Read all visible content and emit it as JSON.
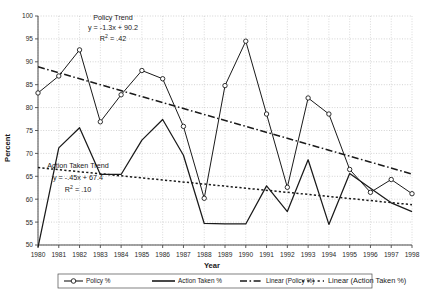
{
  "chart_data": {
    "type": "line",
    "title": "",
    "xlabel": "Year",
    "ylabel": "Percent",
    "ylim": [
      50,
      100
    ],
    "ytick_step": 5,
    "grid": true,
    "legend_position": "bottom",
    "categories": [
      1980,
      1981,
      1982,
      1983,
      1984,
      1985,
      1986,
      1987,
      1988,
      1989,
      1990,
      1991,
      1992,
      1993,
      1994,
      1995,
      1996,
      1997,
      1998
    ],
    "xtick_labels": [
      "1980",
      "1981",
      "1982",
      "1983",
      "1984",
      "1985",
      "1986",
      "1987",
      "1988",
      "1989",
      "1990",
      "1991",
      "1992",
      "1993",
      "1994",
      "1995",
      "1996",
      "1997",
      "1998"
    ],
    "ytick_labels": [
      "50",
      "55",
      "60",
      "65",
      "70",
      "75",
      "80",
      "85",
      "90",
      "95",
      "100"
    ],
    "series": [
      {
        "name": "Policy %",
        "marker": "open-circle",
        "style": "solid",
        "values": [
          83.2,
          86.9,
          92.6,
          76.9,
          82.8,
          88.1,
          86.3,
          75.9,
          60.2,
          84.8,
          94.5,
          78.6,
          62.6,
          82.1,
          78.6,
          66.5,
          61.5,
          64.3,
          61.2
        ]
      },
      {
        "name": "Action Taken %",
        "marker": "none",
        "style": "solid",
        "values": [
          49.5,
          71.2,
          75.6,
          65.4,
          65.4,
          72.9,
          77.4,
          69.6,
          54.7,
          54.6,
          54.6,
          62.9,
          57.3,
          68.6,
          54.5,
          65.6,
          62.4,
          59.2,
          57.3
        ]
      }
    ],
    "trendlines": [
      {
        "name": "Linear (Policy %)",
        "style": "dash-dot",
        "equation": "y = -1.3x + 90.2",
        "r_squared": ".42",
        "label_title": "Policy Trend",
        "slope": -1.3,
        "intercept": 90.2,
        "y_start": 88.9,
        "y_end": 65.5
      },
      {
        "name": "Linear (Action Taken %)",
        "style": "dotted",
        "equation": "y = -.45x + 67.4",
        "r_squared": ".10",
        "label_title": "Action Taken Trend",
        "slope": -0.45,
        "intercept": 67.4,
        "y_start": 66.9,
        "y_end": 58.8
      }
    ],
    "annotations": [
      {
        "id": "policy-trend",
        "line1": "Policy Trend",
        "line2_prefix": "y = -1.3x + 90.2",
        "line3_prefix": "R",
        "line3_sup": "2",
        "line3_suffix": " = .42"
      },
      {
        "id": "action-taken-trend",
        "line1": "Action Taken Trend",
        "line2_prefix": "y = -.45x + 67.4",
        "line3_prefix": "R",
        "line3_sup": "2",
        "line3_suffix": " = .10"
      }
    ],
    "legend": [
      {
        "label": "Policy %",
        "style": "solid-marker"
      },
      {
        "label": "Action Taken %",
        "style": "solid"
      },
      {
        "label": "Linear (Policy %)",
        "style": "dash-dot"
      },
      {
        "label": "Linear (Action Taken %)",
        "style": "dotted"
      }
    ],
    "colors": {
      "line": "#1a1a1a",
      "grid": "#b5b5b5",
      "axis": "#4a4a4a",
      "background": "#ffffff"
    }
  }
}
